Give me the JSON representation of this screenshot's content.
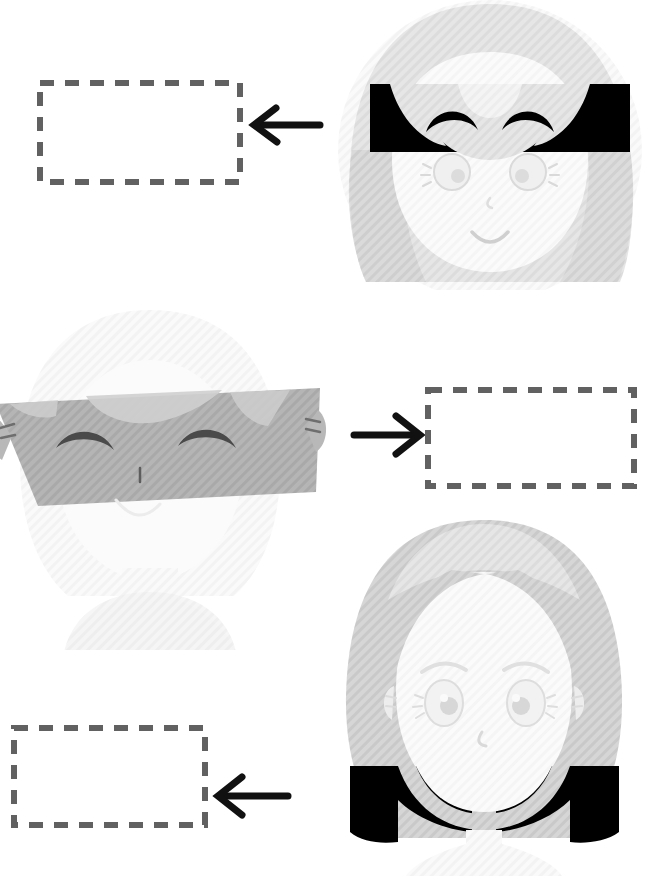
{
  "page": {
    "title": "Faces and empty answer boxes worksheet",
    "background_color": "#ffffff",
    "width": 649,
    "height": 876
  },
  "colors": {
    "dash_stroke": "#616161",
    "arrow_stroke": "#111111",
    "hair_light": "#e3e3e3",
    "hair_mid": "#d2d2d2",
    "hair_pale": "#f1f1f1",
    "skin": "#fbfbfb",
    "skin_shade": "#f4f4f4",
    "line_soft": "#d8d8d8",
    "censor_black": "#000000",
    "censor_gray": "#b0b0b0",
    "ghost": "#f7f7f7"
  },
  "items": [
    {
      "id": "item-1",
      "order": "1",
      "answer_box": {
        "name": "answer-box-1",
        "value": "",
        "placeholder": "",
        "x": 37,
        "y": 80,
        "w": 206,
        "h": 105
      },
      "arrow": {
        "name": "arrow-left-1",
        "direction": "left",
        "x": 248,
        "y": 104,
        "w": 76,
        "h": 46
      },
      "face": {
        "name": "face-smiling-censored",
        "expression": "smiling",
        "censor_bar": "black",
        "censor_position": "eyes",
        "x": 330,
        "y": 0,
        "w": 319,
        "h": 285
      }
    },
    {
      "id": "item-2",
      "order": "2",
      "answer_box": {
        "name": "answer-box-2",
        "value": "",
        "placeholder": "",
        "x": 425,
        "y": 387,
        "w": 212,
        "h": 102
      },
      "arrow": {
        "name": "arrow-right-2",
        "direction": "right",
        "x": 352,
        "y": 412,
        "w": 72,
        "h": 46
      },
      "face": {
        "name": "face-closed-eyes-faded",
        "expression": "closed-eyes",
        "censor_bar": "gray",
        "censor_position": "eyes",
        "x": 0,
        "y": 300,
        "w": 320,
        "h": 350
      }
    },
    {
      "id": "item-3",
      "order": "3",
      "answer_box": {
        "name": "answer-box-3",
        "value": "",
        "placeholder": "",
        "x": 11,
        "y": 725,
        "w": 197,
        "h": 103
      },
      "arrow": {
        "name": "arrow-left-3",
        "direction": "left",
        "x": 214,
        "y": 772,
        "w": 76,
        "h": 48
      },
      "face": {
        "name": "face-sad",
        "expression": "sad",
        "censor_bar": "black",
        "censor_position": "shoulders",
        "x": 320,
        "y": 500,
        "w": 329,
        "h": 376
      }
    }
  ]
}
